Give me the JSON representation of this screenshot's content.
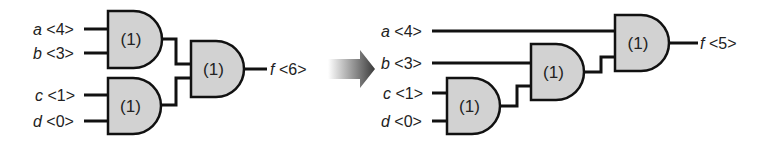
{
  "diagram": {
    "colors": {
      "gate_fill": "#d2d2d2",
      "wire": "#111111",
      "text": "#222222",
      "arrow_start": "#ffffff",
      "arrow_end": "#3a3a3a"
    },
    "left_circuit": {
      "name": "balanced-tree",
      "inputs": [
        {
          "var": "a",
          "time": "<4>",
          "x": 33,
          "y": 29,
          "wire_x1": 84,
          "wire_x2": 108
        },
        {
          "var": "b",
          "time": "<3>",
          "x": 33,
          "y": 53,
          "wire_x1": 84,
          "wire_x2": 108
        },
        {
          "var": "c",
          "time": "<1>",
          "x": 35,
          "y": 95,
          "wire_x1": 84,
          "wire_x2": 108
        },
        {
          "var": "d",
          "time": "<0>",
          "x": 33,
          "y": 121,
          "wire_x1": 84,
          "wire_x2": 108
        }
      ],
      "gates": [
        {
          "id": "L1",
          "label": "(1)",
          "x": 108,
          "y": 11,
          "w": 54,
          "h": 57
        },
        {
          "id": "L2",
          "label": "(1)",
          "x": 108,
          "y": 78,
          "w": 53,
          "h": 56
        },
        {
          "id": "L3",
          "label": "(1)",
          "x": 191,
          "y": 41,
          "w": 53,
          "h": 56
        }
      ],
      "wires": [
        "M162,39 L176,39 L176,64 L191,64",
        "M161,105 L176,105 L176,78 L191,78",
        "M244,69 L267,69"
      ],
      "output": {
        "var": "f",
        "time": "<6>",
        "x": 270,
        "y": 69
      }
    },
    "arrow": {
      "label": "transform-arrow",
      "x1": 328,
      "x2": 375,
      "y_center": 69
    },
    "right_circuit": {
      "name": "chained-tree",
      "inputs": [
        {
          "var": "a",
          "time": "<4>",
          "x": 381,
          "y": 31,
          "wire_x1": 432,
          "wire_x2": 615,
          "wire_y": 31
        },
        {
          "var": "b",
          "time": "<3>",
          "x": 381,
          "y": 63,
          "wire_x1": 432,
          "wire_x2": 531,
          "wire_y": 63
        },
        {
          "var": "c",
          "time": "<1>",
          "x": 383,
          "y": 93,
          "wire_x1": 432,
          "wire_x2": 447,
          "wire_y": 93
        },
        {
          "var": "d",
          "time": "<0>",
          "x": 381,
          "y": 121,
          "wire_x1": 432,
          "wire_x2": 447,
          "wire_y": 121
        }
      ],
      "gates": [
        {
          "id": "R1",
          "label": "(1)",
          "x": 447,
          "y": 78,
          "w": 53,
          "h": 56
        },
        {
          "id": "R2",
          "label": "(1)",
          "x": 531,
          "y": 44,
          "w": 53,
          "h": 56
        },
        {
          "id": "R3",
          "label": "(1)",
          "x": 615,
          "y": 15,
          "w": 54,
          "h": 56
        }
      ],
      "wires": [
        "M500,106 L517,106 L517,86 L531,86",
        "M584,72 L601,72 L601,57 L615,57",
        "M669,43 L698,43"
      ],
      "output": {
        "var": "f",
        "time": "<5>",
        "x": 700,
        "y": 43
      }
    }
  }
}
